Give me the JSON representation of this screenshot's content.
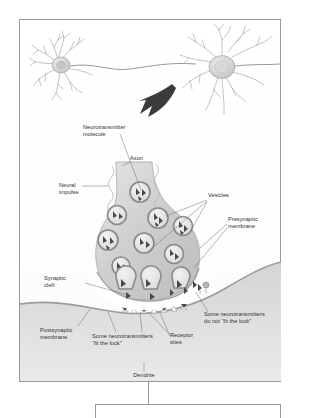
{
  "figure": {
    "type": "biology-diagram",
    "frame": {
      "border_color": "#9a9a9a",
      "background": "#ffffff"
    },
    "palette": {
      "neuron_outline": "#8d8d8d",
      "neuron_fill": "#d9d9d9",
      "terminal_fill": "#c9c9c9",
      "vesicle_ring": "#8a8a8a",
      "vesicle_fill": "#e3e3e3",
      "molecule": "#4a4a4a",
      "membrane": "#a0a0a0",
      "postsynaptic_fill": "#cfcfcf",
      "arrow": "#3b3b3b",
      "leader_line": "#6e6e6e",
      "text": "#2e2e2e"
    }
  },
  "labels": {
    "neurotransmitter_molecule": "Neurotransmitter\nmolecule",
    "axon": "Axon",
    "neural_impulse": "Neural\nimpulse",
    "vesicles": "Vesicles",
    "presynaptic_membrane": "Presynaptic\nmembrane",
    "synaptic_cleft": "Synaptic\ncleft",
    "postsynaptic_membrane": "Postsynaptic\nmembrane",
    "fit_the_lock": "Some neurotransmitters\n“fit the lock”",
    "receptor_sites": "Receptor\nsites",
    "do_not_fit_the_lock": "Some neurotransmitters\ndo not “fit the lock”",
    "dendrite": "Dendrite"
  },
  "neurons": [
    {
      "name": "presynaptic-neuron",
      "position": "upper-left",
      "has_nucleus": true,
      "axon_direction": "right"
    },
    {
      "name": "postsynaptic-neuron",
      "position": "upper-right",
      "has_nucleus": true,
      "axon_direction": "right"
    }
  ],
  "zoom_arrow": {
    "name": "magnify-arrow",
    "direction": "down-left"
  },
  "vesicle_count": 11,
  "released_molecule_count": 9
}
